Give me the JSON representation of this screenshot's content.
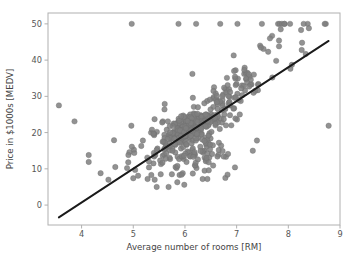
{
  "chart_data": {
    "type": "scatter",
    "title": "",
    "xlabel": "Average number of rooms [RM]",
    "ylabel": "Price in $1000s [MEDV]",
    "xlim": [
      3.35,
      9.0
    ],
    "ylim": [
      -5.5,
      53.0
    ],
    "xticks": [
      4,
      5,
      6,
      7,
      8,
      9
    ],
    "yticks": [
      0,
      10,
      20,
      30,
      40,
      50
    ],
    "xtick_labels": [
      "4",
      "5",
      "6",
      "7",
      "8",
      "9"
    ],
    "ytick_labels": [
      "0",
      "10",
      "20",
      "30",
      "40",
      "50"
    ],
    "grid": false,
    "legend": null,
    "marker_color": "#7f7f7f",
    "marker_edge_color": "#6e6e6e",
    "marker_size_px": 5.4,
    "marker_opacity": 0.85,
    "frame_color": "#b0b0b0",
    "background_color": "#ffffff",
    "series": [
      {
        "name": "RM vs MEDV",
        "type": "scatter",
        "x": [
          6.575,
          6.421,
          7.185,
          6.998,
          7.147,
          6.43,
          6.012,
          6.172,
          5.631,
          6.004,
          6.377,
          6.009,
          5.889,
          5.949,
          6.096,
          5.834,
          5.935,
          5.99,
          5.456,
          5.727,
          5.57,
          5.965,
          6.142,
          5.813,
          5.924,
          5.599,
          5.813,
          6.047,
          6.495,
          6.674,
          5.713,
          6.072,
          5.95,
          5.701,
          6.096,
          5.933,
          5.841,
          5.85,
          5.966,
          6.595,
          7.024,
          6.77,
          6.169,
          6.211,
          6.069,
          5.682,
          5.786,
          6.03,
          5.399,
          5.602,
          5.963,
          6.115,
          6.511,
          5.998,
          5.888,
          7.249,
          6.383,
          6.816,
          6.145,
          5.927,
          5.741,
          5.966,
          6.456,
          6.762,
          7.104,
          6.29,
          5.787,
          5.878,
          5.594,
          5.885,
          6.417,
          5.961,
          6.065,
          6.245,
          6.273,
          6.286,
          6.279,
          6.14,
          6.232,
          5.874,
          6.727,
          6.619,
          6.302,
          6.167,
          6.389,
          6.63,
          6.015,
          6.121,
          7.007,
          7.079,
          6.417,
          6.405,
          6.442,
          6.211,
          6.249,
          6.625,
          6.163,
          8.069,
          7.82,
          7.416,
          6.727,
          6.781,
          6.405,
          6.137,
          6.167,
          5.851,
          5.836,
          6.127,
          6.474,
          6.229,
          6.195,
          6.715,
          5.913,
          6.092,
          6.254,
          5.928,
          6.176,
          6.021,
          5.872,
          5.731,
          5.87,
          6.004,
          5.961,
          5.856,
          5.879,
          5.986,
          5.613,
          5.693,
          6.431,
          5.637,
          6.458,
          6.326,
          6.372,
          5.822,
          5.757,
          6.335,
          5.942,
          6.454,
          5.857,
          6.151,
          6.174,
          5.019,
          5.403,
          5.468,
          4.903,
          6.13,
          5.628,
          4.926,
          5.186,
          5.597,
          6.122,
          5.404,
          5.012,
          5.709,
          6.129,
          6.152,
          5.272,
          6.943,
          6.066,
          6.51,
          6.25,
          7.489,
          7.802,
          8.375,
          5.854,
          6.101,
          7.929,
          5.877,
          6.319,
          6.402,
          5.875,
          5.88,
          5.572,
          6.416,
          5.859,
          6.546,
          6.02,
          6.315,
          6.86,
          6.98,
          7.765,
          6.144,
          7.155,
          6.563,
          5.604,
          6.153,
          7.831,
          6.782,
          6.556,
          7.185,
          6.951,
          6.739,
          7.178,
          6.8,
          6.604,
          7.875,
          7.287,
          7.107,
          7.274,
          6.975,
          7.135,
          6.162,
          7.61,
          7.853,
          8.034,
          5.891,
          6.326,
          5.783,
          6.064,
          5.344,
          5.96,
          5.404,
          5.807,
          6.375,
          5.412,
          6.182,
          5.888,
          6.642,
          5.951,
          6.373,
          6.951,
          6.164,
          6.879,
          6.618,
          8.266,
          8.725,
          8.04,
          7.163,
          7.686,
          6.552,
          5.981,
          7.412,
          8.337,
          8.247,
          6.726,
          6.086,
          6.631,
          7.358,
          6.481,
          6.606,
          6.897,
          6.095,
          6.358,
          6.393,
          5.593,
          5.605,
          6.108,
          6.226,
          6.433,
          6.718,
          6.487,
          6.438,
          6.957,
          8.259,
          6.108,
          5.876,
          7.454,
          8.704,
          7.333,
          6.842,
          7.203,
          7.52,
          8.398,
          7.327,
          7.206,
          5.56,
          7.014,
          8.297,
          7.47,
          5.92,
          5.856,
          6.24,
          6.538,
          7.691,
          6.758,
          6.854,
          7.267,
          6.826,
          6.482,
          6.812,
          7.82,
          6.968,
          7.645,
          7.923,
          7.088,
          6.453,
          6.23,
          6.209,
          6.315,
          6.565,
          6.861,
          7.148,
          6.63,
          6.127,
          6.009,
          6.678,
          6.549,
          5.79,
          6.345,
          7.041,
          6.871,
          6.59,
          6.495,
          6.982,
          7.236,
          6.616,
          7.42,
          6.849,
          6.635,
          5.972,
          4.973,
          6.122,
          6.023,
          6.266,
          6.567,
          5.705,
          5.914,
          5.782,
          6.382,
          6.113,
          6.426,
          6.376,
          6.041,
          5.708,
          6.415,
          6.431,
          6.312,
          6.083,
          5.868,
          6.333,
          6.144,
          5.706,
          6.031,
          6.316,
          6.31,
          6.037,
          5.869,
          5.895,
          6.059,
          5.985,
          5.968,
          7.241,
          6.54,
          6.696,
          6.874,
          6.014,
          5.898,
          6.516,
          6.635,
          6.939,
          6.49,
          6.579,
          5.884,
          6.728,
          5.663,
          5.936,
          6.212,
          6.395,
          6.127,
          6.112,
          6.398,
          6.251,
          5.362,
          5.803,
          8.78,
          3.561,
          4.963,
          3.863,
          4.97,
          6.683,
          7.016,
          6.216,
          5.875,
          4.906,
          4.138,
          7.313,
          6.649,
          6.794,
          6.38,
          6.223,
          6.968,
          6.545,
          5.536,
          5.52,
          4.368,
          5.277,
          4.652,
          5.0,
          4.88,
          5.39,
          5.713,
          6.051,
          5.036,
          6.193,
          5.887,
          6.471,
          6.405,
          5.747,
          5.453,
          5.852,
          5.987,
          6.343,
          6.404,
          5.349,
          5.531,
          5.683,
          4.138,
          5.608,
          5.617,
          6.852,
          5.757,
          6.657,
          4.628,
          5.155,
          4.519,
          6.434,
          6.782,
          5.304,
          5.957,
          6.824,
          6.411,
          6.006,
          5.648,
          6.103,
          5.565,
          5.896,
          5.837,
          6.202,
          6.193,
          6.38,
          6.348,
          6.833,
          6.425,
          6.436,
          6.208,
          6.629,
          6.461,
          6.152,
          5.935,
          5.627,
          5.818,
          6.406,
          6.219,
          6.485,
          5.854,
          6.459,
          6.341,
          6.251,
          6.185,
          6.417,
          6.749,
          6.655,
          6.297,
          7.393,
          6.728,
          6.525,
          5.976,
          5.936,
          6.301,
          6.081,
          6.701,
          6.376,
          6.317,
          6.513,
          6.209,
          5.759,
          5.952,
          6.003,
          5.926,
          5.713,
          6.167,
          6.229,
          6.437,
          6.98,
          5.427,
          6.162,
          6.484,
          5.304,
          6.185,
          6.229,
          6.242,
          6.75,
          7.061,
          5.762,
          5.871,
          6.312,
          6.114,
          5.905,
          5.454,
          5.414,
          5.093,
          5.983,
          5.983,
          5.707,
          5.926,
          5.67,
          5.39,
          5.794,
          6.019,
          5.569,
          6.027,
          6.593,
          6.12,
          6.976,
          6.794,
          6.03
        ],
        "y": [
          24.0,
          21.6,
          34.7,
          33.4,
          36.2,
          28.7,
          22.9,
          27.1,
          16.5,
          18.9,
          15.0,
          18.9,
          21.7,
          20.4,
          18.2,
          19.9,
          23.1,
          17.5,
          20.2,
          18.2,
          13.6,
          19.6,
          15.2,
          14.5,
          15.6,
          13.9,
          16.6,
          14.8,
          18.4,
          21.0,
          12.7,
          14.5,
          13.2,
          13.1,
          13.5,
          18.9,
          20.0,
          21.0,
          24.7,
          30.8,
          34.9,
          26.6,
          25.3,
          24.7,
          21.2,
          19.3,
          20.0,
          16.6,
          14.4,
          19.4,
          19.7,
          20.5,
          25.0,
          23.4,
          18.9,
          35.4,
          24.7,
          31.6,
          23.3,
          19.6,
          18.7,
          16.0,
          22.2,
          25.0,
          33.0,
          23.5,
          19.4,
          22.0,
          17.4,
          20.9,
          24.2,
          21.7,
          22.8,
          23.4,
          24.1,
          21.4,
          20.0,
          20.8,
          21.2,
          20.3,
          28.0,
          23.9,
          24.8,
          22.9,
          23.9,
          26.6,
          22.5,
          22.2,
          23.6,
          28.7,
          22.6,
          22.0,
          22.9,
          25.0,
          20.6,
          28.4,
          21.4,
          38.7,
          43.8,
          33.2,
          27.5,
          26.5,
          18.6,
          19.3,
          20.1,
          19.5,
          19.5,
          20.4,
          19.8,
          19.4,
          21.7,
          22.8,
          18.8,
          18.7,
          18.5,
          18.3,
          21.2,
          19.2,
          20.4,
          19.3,
          22.0,
          20.3,
          20.5,
          17.3,
          18.8,
          21.4,
          15.7,
          16.2,
          18.0,
          14.3,
          19.2,
          19.6,
          23.0,
          18.4,
          15.6,
          18.1,
          17.4,
          17.1,
          13.3,
          17.8,
          14.0,
          14.4,
          13.4,
          15.6,
          11.8,
          13.8,
          15.6,
          14.6,
          17.8,
          15.4,
          21.5,
          19.6,
          15.3,
          19.4,
          17.0,
          15.6,
          13.1,
          41.3,
          24.3,
          23.3,
          27.0,
          50.0,
          50.0,
          50.0,
          22.7,
          25.0,
          50.0,
          23.8,
          23.8,
          22.3,
          17.4,
          19.1,
          23.1,
          23.6,
          22.6,
          29.4,
          23.2,
          24.6,
          29.9,
          37.2,
          39.8,
          36.2,
          37.9,
          32.5,
          26.4,
          29.6,
          50.0,
          32.0,
          29.8,
          34.9,
          37.0,
          30.5,
          36.4,
          31.1,
          29.1,
          50.0,
          33.3,
          30.3,
          34.6,
          34.9,
          32.9,
          24.1,
          42.3,
          48.5,
          50.0,
          22.6,
          24.4,
          22.5,
          24.4,
          20.0,
          21.7,
          19.3,
          22.4,
          28.1,
          23.7,
          25.0,
          23.3,
          28.7,
          21.5,
          23.0,
          26.7,
          21.7,
          27.5,
          30.1,
          44.8,
          50.0,
          37.6,
          31.6,
          46.7,
          31.5,
          24.3,
          31.7,
          41.7,
          48.3,
          29.0,
          24.0,
          25.1,
          31.5,
          23.7,
          23.3,
          22.0,
          20.1,
          22.2,
          23.7,
          17.6,
          18.5,
          24.3,
          20.5,
          24.5,
          26.2,
          24.4,
          24.8,
          29.6,
          42.8,
          21.9,
          20.9,
          44.0,
          50.0,
          36.0,
          30.1,
          33.8,
          43.1,
          48.8,
          31.0,
          36.5,
          22.8,
          30.7,
          50.0,
          43.5,
          20.7,
          21.1,
          25.2,
          24.4,
          35.2,
          32.4,
          32.0,
          33.2,
          33.1,
          29.1,
          35.1,
          45.4,
          35.4,
          46.0,
          50.0,
          32.2,
          22.0,
          20.1,
          23.2,
          22.3,
          24.8,
          28.5,
          37.3,
          27.9,
          23.9,
          21.7,
          28.6,
          27.1,
          20.3,
          22.5,
          29.0,
          24.8,
          22.0,
          26.4,
          33.1,
          36.1,
          28.4,
          33.4,
          28.2,
          22.8,
          20.3,
          16.1,
          22.1,
          19.4,
          21.6,
          23.8,
          16.2,
          17.8,
          19.8,
          23.1,
          21.0,
          23.8,
          23.1,
          20.4,
          18.5,
          25.0,
          24.6,
          23.0,
          22.2,
          19.3,
          22.6,
          19.8,
          17.1,
          19.4,
          22.2,
          20.7,
          21.1,
          19.5,
          18.5,
          20.6,
          19.0,
          18.7,
          32.7,
          16.5,
          23.9,
          31.2,
          17.5,
          17.2,
          23.1,
          24.5,
          26.6,
          22.9,
          24.1,
          18.6,
          30.1,
          18.2,
          20.6,
          17.8,
          21.7,
          22.7,
          22.6,
          25.0,
          19.9,
          20.8,
          16.8,
          21.9,
          27.5,
          21.9,
          23.1,
          50.0,
          50.0,
          50.0,
          50.0,
          50.0,
          13.8,
          13.8,
          15.0,
          13.9,
          13.3,
          13.1,
          10.2,
          10.4,
          10.9,
          11.3,
          12.3,
          8.8,
          7.2,
          10.5,
          7.4,
          10.2,
          11.5,
          15.1,
          23.2,
          9.7,
          13.8,
          12.7,
          13.1,
          12.5,
          8.5,
          5.0,
          6.3,
          5.6,
          7.2,
          12.1,
          8.3,
          8.5,
          5.0,
          11.9,
          27.9,
          17.2,
          27.5,
          15.0,
          17.2,
          17.9,
          16.3,
          7.0,
          7.2,
          7.5,
          10.4,
          8.8,
          8.4,
          16.7,
          14.2,
          20.8,
          13.4,
          11.7,
          8.3,
          10.2,
          10.9,
          11.0,
          9.5,
          14.5,
          14.1,
          16.1,
          14.3,
          11.7,
          13.4,
          9.6,
          8.7,
          8.4,
          12.8,
          10.5,
          17.1,
          18.4,
          15.4,
          10.8,
          11.8,
          14.9,
          12.6,
          14.1,
          13.0,
          13.4,
          15.2,
          16.1,
          17.8,
          14.9,
          14.1,
          12.7,
          13.5,
          14.9,
          20.0,
          16.4,
          17.7,
          19.5,
          20.2,
          21.4,
          19.9,
          19.0,
          19.1,
          19.1,
          20.1,
          19.9,
          19.6,
          23.2,
          29.8,
          13.8,
          13.3,
          16.7,
          12.0,
          14.6,
          21.4,
          23.0,
          23.7,
          25.0,
          21.8,
          20.6,
          21.2,
          19.1,
          20.6,
          15.2,
          7.0,
          8.1,
          13.6,
          20.1,
          21.8,
          24.5,
          23.1,
          19.7,
          18.3,
          21.2,
          17.5,
          16.8,
          22.4,
          20.6,
          23.9,
          22.0,
          11.9
        ]
      }
    ],
    "fit_line": {
      "name": "linear-regression-fit",
      "color": "#1a1a1a",
      "width_px": 1.9,
      "x": [
        3.56,
        8.78
      ],
      "y": [
        -3.4,
        45.3
      ],
      "slope": 9.1,
      "intercept": -35.8
    }
  }
}
